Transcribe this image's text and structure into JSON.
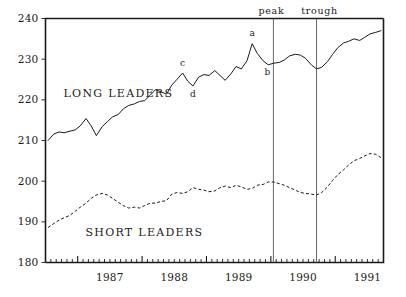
{
  "chart_data": {
    "type": "line",
    "title": "",
    "xlabel": "",
    "ylabel": "",
    "ylim": [
      180,
      240
    ],
    "xlim": [
      1986.5,
      1991.75
    ],
    "grid": false,
    "legend_position": "inline-annotation",
    "y_ticks": [
      180,
      190,
      200,
      210,
      220,
      230,
      240
    ],
    "y_tick_labels": [
      "180",
      "190",
      "200",
      "210",
      "220",
      "230",
      "240"
    ],
    "x_tick_labels": [
      "1987",
      "1988",
      "1989",
      "1990",
      "1991"
    ],
    "x_tick_values": [
      1987,
      1988,
      1989,
      1990,
      1991
    ],
    "x_minor_tick_interval_months": 1,
    "series": [
      {
        "name": "LONG LEADERS",
        "style": "solid",
        "label_x": 1986.78,
        "label_y": 221.6,
        "x": [
          1986.54,
          1986.63,
          1986.71,
          1986.79,
          1986.88,
          1986.96,
          1987.04,
          1987.13,
          1987.21,
          1987.29,
          1987.38,
          1987.46,
          1987.54,
          1987.63,
          1987.71,
          1987.79,
          1987.88,
          1987.96,
          1988.04,
          1988.13,
          1988.21,
          1988.29,
          1988.38,
          1988.46,
          1988.54,
          1988.63,
          1988.71,
          1988.79,
          1988.88,
          1988.96,
          1989.04,
          1989.13,
          1989.21,
          1989.29,
          1989.38,
          1989.46,
          1989.54,
          1989.63,
          1989.71,
          1989.79,
          1989.88,
          1989.96,
          1990.04,
          1990.13,
          1990.21,
          1990.29,
          1990.38,
          1990.46,
          1990.54,
          1990.63,
          1990.71,
          1990.79,
          1990.88,
          1990.96,
          1991.04,
          1991.13,
          1991.21,
          1991.29,
          1991.38,
          1991.46,
          1991.54,
          1991.63,
          1991.71
        ],
        "values": [
          210.0,
          211.6,
          212.1,
          211.9,
          212.3,
          212.6,
          213.6,
          215.4,
          213.6,
          211.2,
          213.4,
          214.6,
          215.8,
          216.4,
          217.8,
          218.6,
          219.0,
          219.6,
          219.8,
          221.2,
          222.5,
          222.0,
          221.4,
          223.6,
          225.0,
          226.6,
          224.6,
          223.4,
          225.6,
          226.2,
          226.0,
          227.2,
          226.0,
          224.8,
          226.4,
          228.2,
          227.6,
          229.6,
          233.8,
          231.4,
          229.6,
          228.6,
          229.0,
          229.2,
          229.8,
          230.8,
          231.2,
          231.0,
          230.2,
          228.6,
          227.6,
          228.0,
          229.4,
          231.2,
          232.8,
          234.0,
          234.4,
          235.0,
          234.6,
          235.4,
          236.2,
          236.6,
          237.0
        ]
      },
      {
        "name": "SHORT LEADERS",
        "style": "dashed",
        "label_x": 1987.12,
        "label_y": 187.4,
        "x": [
          1986.54,
          1986.63,
          1986.71,
          1986.79,
          1986.88,
          1986.96,
          1987.04,
          1987.13,
          1987.21,
          1987.29,
          1987.38,
          1987.46,
          1987.54,
          1987.63,
          1987.71,
          1987.79,
          1987.88,
          1987.96,
          1988.04,
          1988.13,
          1988.21,
          1988.29,
          1988.38,
          1988.46,
          1988.54,
          1988.63,
          1988.71,
          1988.79,
          1988.88,
          1988.96,
          1989.04,
          1989.13,
          1989.21,
          1989.29,
          1989.38,
          1989.46,
          1989.54,
          1989.63,
          1989.71,
          1989.79,
          1989.88,
          1989.96,
          1990.04,
          1990.13,
          1990.21,
          1990.29,
          1990.38,
          1990.46,
          1990.54,
          1990.63,
          1990.71,
          1990.79,
          1990.88,
          1990.96,
          1991.04,
          1991.13,
          1991.21,
          1991.29,
          1991.38,
          1991.46,
          1991.54,
          1991.63,
          1991.71
        ],
        "values": [
          188.6,
          189.6,
          190.4,
          191.0,
          191.6,
          192.6,
          193.6,
          194.6,
          195.8,
          196.6,
          197.0,
          196.6,
          195.8,
          194.8,
          194.0,
          193.4,
          193.6,
          193.4,
          194.0,
          194.6,
          194.6,
          195.0,
          195.2,
          196.8,
          197.2,
          197.0,
          197.4,
          198.4,
          198.0,
          197.8,
          197.4,
          197.6,
          198.4,
          198.8,
          198.4,
          199.0,
          198.6,
          198.0,
          198.2,
          199.0,
          199.2,
          199.8,
          199.8,
          199.4,
          199.0,
          198.4,
          197.8,
          197.2,
          197.0,
          196.8,
          196.6,
          197.2,
          198.6,
          200.2,
          201.6,
          202.8,
          204.0,
          205.0,
          205.6,
          206.2,
          206.8,
          206.6,
          205.8
        ]
      }
    ],
    "point_annotations": [
      {
        "label": "a",
        "x": 1989.71,
        "y": 233.8,
        "dx": 0,
        "dy": -8
      },
      {
        "label": "b",
        "x": 1989.96,
        "y": 228.6,
        "dx": -1,
        "dy": 10
      },
      {
        "label": "c",
        "x": 1988.63,
        "y": 226.6,
        "dx": 0,
        "dy": -7
      },
      {
        "label": "d",
        "x": 1988.79,
        "y": 223.4,
        "dx": 0,
        "dy": 11
      }
    ],
    "reference_lines": [
      {
        "label": "peak",
        "x": 1990.04,
        "label_dx": -2
      },
      {
        "label": "trough",
        "x": 1990.71,
        "label_dx": 3
      }
    ]
  }
}
